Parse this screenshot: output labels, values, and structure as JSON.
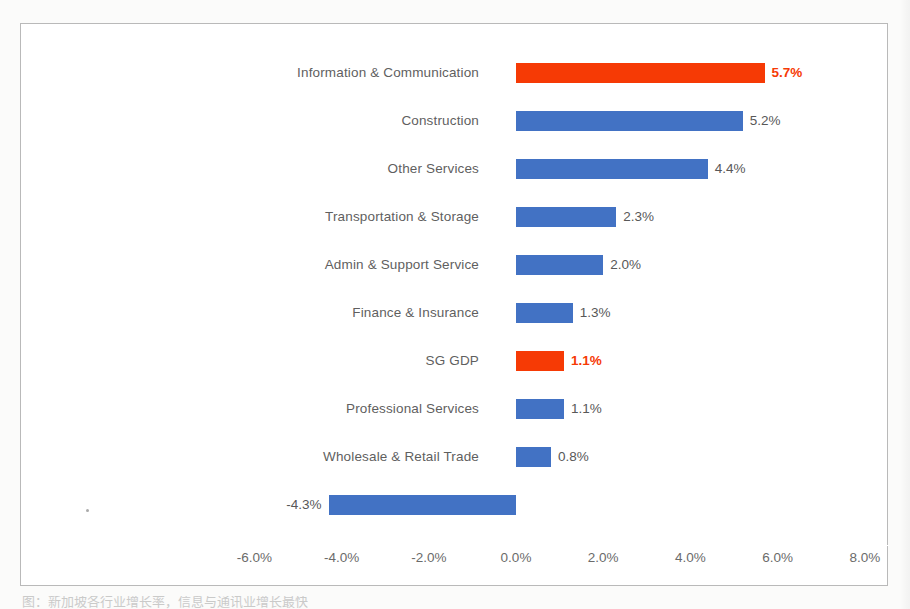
{
  "chart_data": {
    "type": "bar",
    "orientation": "horizontal",
    "title": "",
    "subtitle": "",
    "xlabel": "",
    "ylabel": "",
    "xlim": [
      -7.0,
      8.0
    ],
    "grid": false,
    "legend": null,
    "categories": [
      "Information & Communication",
      "Construction",
      "Other Services",
      "Transportation & Storage",
      "Admin & Support Service",
      "Finance & Insurance",
      "SG GDP",
      "Professional Services",
      "Wholesale & Retail Trade",
      "Manfacturing"
    ],
    "values": [
      5.7,
      5.2,
      4.4,
      2.3,
      2.0,
      1.3,
      1.1,
      1.1,
      0.8,
      -4.3
    ],
    "data_labels": [
      "5.7%",
      "5.2%",
      "4.4%",
      "2.3%",
      "2.0%",
      "1.3%",
      "1.1%",
      "1.1%",
      "0.8%",
      "-4.3%"
    ],
    "bar_colors": [
      "red",
      "blue",
      "blue",
      "blue",
      "blue",
      "blue",
      "red",
      "blue",
      "blue",
      "blue"
    ],
    "highlighted": [
      "Information & Communication",
      "SG GDP"
    ],
    "xticks": [
      -6.0,
      -4.0,
      -2.0,
      0.0,
      2.0,
      4.0,
      6.0,
      8.0
    ],
    "xtick_labels": [
      "-6.0%",
      "-4.0%",
      "-2.0%",
      "0.0%",
      "2.0%",
      "4.0%",
      "6.0%",
      "8.0%"
    ],
    "colors": {
      "series_blue": "#4272c4",
      "series_red": "#f63a05",
      "label_text": "#585858",
      "category_text": "#5f5f5f",
      "axis_text": "#6b6b6b",
      "plot_border": "#b9b9b9",
      "plot_background": "#ffffff"
    }
  },
  "caption": {
    "text": "图：新加坡各行业增长率，信息与通讯业增长最快"
  }
}
